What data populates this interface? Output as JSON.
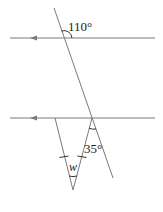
{
  "diagram": {
    "type": "geometry",
    "colors": {
      "line": "#7a7a7a",
      "text": "#222222",
      "background": "#ffffff"
    },
    "labels": {
      "angle_top": "110°",
      "angle_bottom": "35°",
      "unknown": "w"
    },
    "parallel_lines": [
      {
        "name": "upper",
        "arrow_direction": "left"
      },
      {
        "name": "lower",
        "arrow_direction": "left"
      }
    ],
    "tick_marks": {
      "count": 2,
      "meaning": "congruent sides of triangle"
    }
  }
}
